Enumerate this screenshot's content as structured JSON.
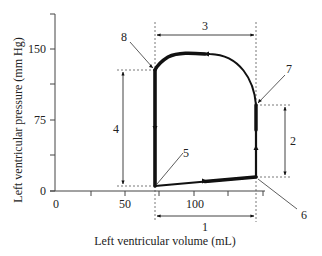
{
  "diagram": {
    "type": "pressure-volume loop",
    "x_axis": {
      "label": "Left ventricular volume (mL)",
      "ticks": [
        "0",
        "50",
        "100"
      ],
      "tick_values": [
        0,
        50,
        100
      ],
      "minor_ticks": [
        25,
        75,
        125,
        150
      ]
    },
    "y_axis": {
      "label": "Left ventricular pressure (mm Hg)",
      "ticks": [
        "0",
        "75",
        "150"
      ],
      "tick_values": [
        0,
        75,
        150
      ],
      "minor_ticks": [
        37.5,
        112.5,
        187.5
      ]
    },
    "loop_points": {
      "end_systolic_low": {
        "volume": 72,
        "pressure": 5
      },
      "end_diastolic": {
        "volume": 145,
        "pressure": 15
      },
      "aortic_open": {
        "volume": 145,
        "pressure": 92
      },
      "aortic_close": {
        "volume": 72,
        "pressure": 128
      },
      "peak": {
        "volume": 110,
        "pressure": 145
      }
    },
    "callouts": {
      "c1": "1",
      "c2": "2",
      "c3": "3",
      "c4": "4",
      "c5": "5",
      "c6": "6",
      "c7": "7",
      "c8": "8"
    }
  }
}
